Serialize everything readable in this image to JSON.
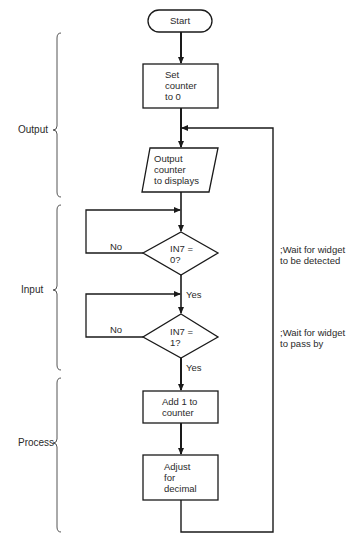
{
  "sections": [
    {
      "label": "Output"
    },
    {
      "label": "Input"
    },
    {
      "label": "Process"
    }
  ],
  "nodes": {
    "start": {
      "type": "terminator",
      "label": "Start"
    },
    "set_counter": {
      "type": "process",
      "label": "Set\ncounter\nto 0"
    },
    "output_counter": {
      "type": "io",
      "label": "Output\ncounter\nto displays"
    },
    "decision1": {
      "type": "decision",
      "label": "IN7 =\n0?"
    },
    "decision2": {
      "type": "decision",
      "label": "IN7 =\n1?"
    },
    "add_counter": {
      "type": "process",
      "label": "Add 1 to\ncounter"
    },
    "adjust_decimal": {
      "type": "process",
      "label": "Adjust\nfor\ndecimal"
    }
  },
  "edges": {
    "d1_no": "No",
    "d1_yes": "Yes",
    "d2_no": "No",
    "d2_yes": "Yes"
  },
  "comments": {
    "c1": ";Wait for widget\nto be detected",
    "c2": ";Wait for widget\nto pass by"
  },
  "colors": {
    "stroke": "#1a1a1a",
    "background": "#ffffff",
    "text": "#2a2a2a"
  }
}
